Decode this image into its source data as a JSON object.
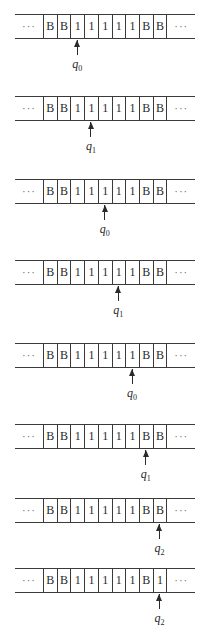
{
  "figure": {
    "ellipsis": "···",
    "tapes": [
      {
        "cells": [
          "B",
          "B",
          "1",
          "1",
          "1",
          "1",
          "1",
          "B",
          "B"
        ],
        "head_index": 2,
        "state": {
          "symbol": "q",
          "subscript": "0"
        }
      },
      {
        "cells": [
          "B",
          "B",
          "1",
          "1",
          "1",
          "1",
          "1",
          "B",
          "B"
        ],
        "head_index": 3,
        "state": {
          "symbol": "q",
          "subscript": "1"
        }
      },
      {
        "cells": [
          "B",
          "B",
          "1",
          "1",
          "1",
          "1",
          "1",
          "B",
          "B"
        ],
        "head_index": 4,
        "state": {
          "symbol": "q",
          "subscript": "0"
        }
      },
      {
        "cells": [
          "B",
          "B",
          "1",
          "1",
          "1",
          "1",
          "1",
          "B",
          "B"
        ],
        "head_index": 5,
        "state": {
          "symbol": "q",
          "subscript": "1"
        }
      },
      {
        "cells": [
          "B",
          "B",
          "1",
          "1",
          "1",
          "1",
          "1",
          "B",
          "B"
        ],
        "head_index": 6,
        "state": {
          "symbol": "q",
          "subscript": "0"
        }
      },
      {
        "cells": [
          "B",
          "B",
          "1",
          "1",
          "1",
          "1",
          "1",
          "B",
          "B"
        ],
        "head_index": 7,
        "state": {
          "symbol": "q",
          "subscript": "1"
        }
      },
      {
        "cells": [
          "B",
          "B",
          "1",
          "1",
          "1",
          "1",
          "1",
          "B",
          "B"
        ],
        "head_index": 8,
        "state": {
          "symbol": "q",
          "subscript": "2"
        }
      },
      {
        "cells": [
          "B",
          "B",
          "1",
          "1",
          "1",
          "1",
          "1",
          "B",
          "1"
        ],
        "head_index": 8,
        "state": {
          "symbol": "q",
          "subscript": "2"
        }
      }
    ]
  }
}
